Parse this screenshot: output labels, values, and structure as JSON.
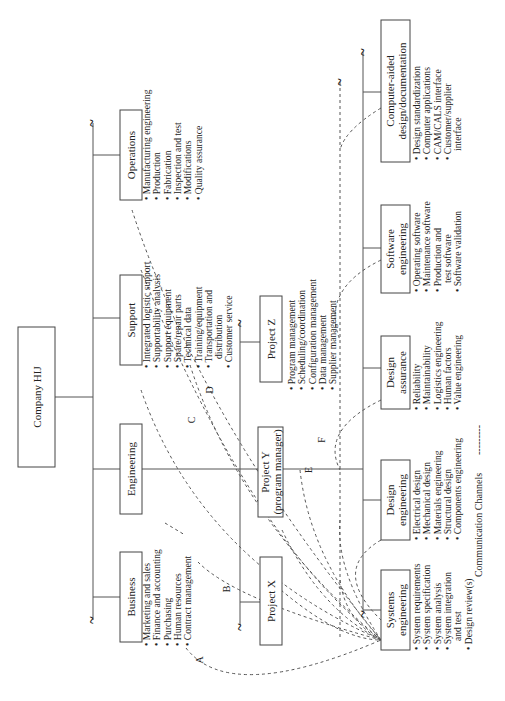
{
  "title": "Company HIJ",
  "colors": {
    "line": "#555555",
    "box_border": "#444444",
    "text": "#222222",
    "background": "#ffffff"
  },
  "root": {
    "label": "Company HIJ"
  },
  "divisions": [
    {
      "id": "business",
      "label": [
        "Business"
      ],
      "items": [
        "Marketing and sales",
        "Finance and accounting",
        "Purchasing",
        "Human resources",
        "Contract management"
      ]
    },
    {
      "id": "engineering",
      "label": [
        "Engineering"
      ],
      "items": []
    },
    {
      "id": "support",
      "label": [
        "Support"
      ],
      "items": [
        "Integrated logistic support",
        "Supportability analysis",
        "Support equipment",
        "Spare/repair parts",
        "Technical data",
        "Training/equipment",
        "Transportation and",
        "   distribution",
        "Customer service"
      ]
    },
    {
      "id": "operations",
      "label": [
        "Operations"
      ],
      "items": [
        "Manufacturing engineering",
        "Production",
        "Fabrication",
        "Inspection and test",
        "Modifications",
        "Quality assurance"
      ]
    }
  ],
  "projects": [
    {
      "id": "project-x",
      "label": [
        "Project X"
      ]
    },
    {
      "id": "project-y",
      "label": [
        "Project Y",
        "(program manager)"
      ],
      "items": [
        "Program management",
        "Scheduling/coordination",
        "Configuration management",
        "Data management",
        "Supplier management"
      ]
    },
    {
      "id": "project-z",
      "label": [
        "Project Z"
      ]
    }
  ],
  "engineering_groups": [
    {
      "id": "systems-engineering",
      "label": [
        "Systems",
        "engineering"
      ],
      "items": [
        "System requirements",
        "System specification",
        "System analysis",
        "System integration",
        "   and test",
        "Design review(s)"
      ]
    },
    {
      "id": "design-engineering",
      "label": [
        "Design",
        "engineering"
      ],
      "items": [
        "Electrical design",
        "Mechanical design",
        "Materials engineering",
        "Structural design",
        "Components engineering"
      ]
    },
    {
      "id": "design-assurance",
      "label": [
        "Design",
        "assurance"
      ],
      "items": [
        "Reliability",
        "Maintainability",
        "Logistics engineering",
        "Human factors",
        "Value engineering"
      ]
    },
    {
      "id": "software-engineering",
      "label": [
        "Software",
        "engineering"
      ],
      "items": [
        "Operating software",
        "Maintenance software",
        "Production and",
        "   test software",
        "Software validation"
      ]
    },
    {
      "id": "cad-documentation",
      "label": [
        "Computer-aided",
        "design/documentation"
      ],
      "items": [
        "Design standardization",
        "Computer applications",
        "CAM/CALS interface",
        "Customer/supplier",
        "   interface"
      ]
    }
  ],
  "channel_labels": [
    "A",
    "B",
    "C",
    "D",
    "E",
    "F"
  ],
  "legend": {
    "label": "Communication Channels",
    "sample": "---------"
  },
  "icons": {
    "break_mark": "~"
  }
}
